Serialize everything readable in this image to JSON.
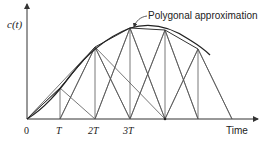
{
  "diagram": {
    "y_axis_label": "c(t)",
    "x_axis_label": "Time",
    "annotation": "Polygonal approximation",
    "tick_labels": [
      "0",
      "T",
      "2T",
      "3T"
    ],
    "colors": {
      "line": "#333333",
      "background": "#ffffff"
    },
    "samples": [
      {
        "t": "0",
        "x": 27,
        "y": 119
      },
      {
        "t": "T",
        "x": 60,
        "y": 88
      },
      {
        "t": "2T",
        "x": 95,
        "y": 47
      },
      {
        "t": "3T",
        "x": 130,
        "y": 28
      },
      {
        "t": "4T",
        "x": 165,
        "y": 30
      },
      {
        "t": "5T",
        "x": 198,
        "y": 49
      }
    ]
  }
}
